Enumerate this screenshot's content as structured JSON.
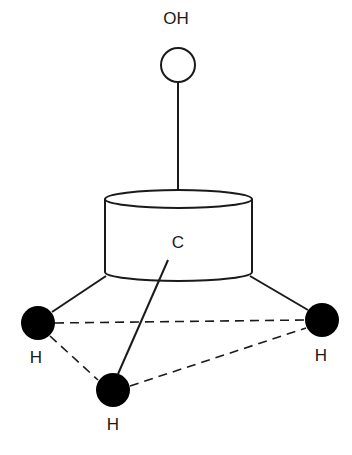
{
  "diagram": {
    "type": "molecular-structure",
    "molecule_part": {
      "top_group": {
        "label": "OH",
        "atom": "oxygen-hydroxyl",
        "style": "open-circle"
      },
      "center": {
        "label": "C",
        "shape": "cylinder"
      },
      "substituents": [
        {
          "label": "H",
          "position": "left",
          "style": "filled-circle"
        },
        {
          "label": "H",
          "position": "right",
          "style": "filled-circle"
        },
        {
          "label": "H",
          "position": "bottom-front",
          "style": "filled-circle"
        }
      ],
      "bond_style": {
        "solid": "carbon-to-substituent",
        "dashed": "triangle-between-hydrogens"
      }
    },
    "colors": {
      "line": "#1a1a1a",
      "atom_fill": "#000000",
      "background": "#ffffff"
    }
  }
}
